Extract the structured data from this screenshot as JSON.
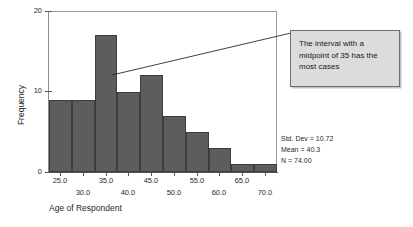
{
  "chart_data": {
    "type": "bar",
    "title": "",
    "subtitle": "",
    "xlabel": "Age of Respondent",
    "ylabel": "Frequency",
    "bin_width": 5,
    "bin_midpoints": [
      25,
      30,
      35,
      40,
      45,
      50,
      55,
      60,
      65,
      70
    ],
    "categories": [
      "25.0",
      "30.0",
      "35.0",
      "40.0",
      "45.0",
      "50.0",
      "55.0",
      "60.0",
      "65.0",
      "70.0"
    ],
    "values": [
      9,
      9,
      17,
      10,
      12,
      7,
      5,
      3,
      1,
      1
    ],
    "xlim": [
      22.5,
      72.5
    ],
    "ylim": [
      0,
      20
    ],
    "y_ticks": [
      "0",
      "10",
      "20"
    ],
    "y_tick_values": [
      0,
      10,
      20
    ],
    "x_ticks_upper": [
      "25.0",
      "35.0",
      "45.0",
      "55.0",
      "65.0"
    ],
    "x_ticks_lower": [
      "30.0",
      "40.0",
      "50.0",
      "60.0",
      "70.0"
    ],
    "grid": false,
    "legend": "none",
    "bar_color": "#5d5d5d",
    "bar_edge_color": "#3d3d3d",
    "annotations": [
      {
        "text": "The interval with a midpoint of 35 has the most cases",
        "points_to_bin_midpoint": 35
      }
    ]
  },
  "statistics": {
    "std_dev": "Std. Dev = 10.72",
    "mean": "Mean = 40.3",
    "n": "N = 74.00"
  },
  "callout": {
    "text": "The interval with a midpoint of 35 has the most cases"
  },
  "axes": {
    "y_title": "Frequency",
    "x_title": "Age of Respondent"
  }
}
